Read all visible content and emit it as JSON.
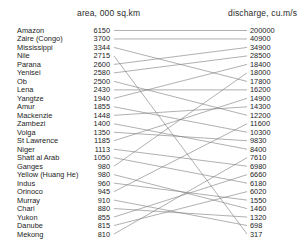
{
  "chart_data": {
    "type": "line",
    "subtype": "slopegraph",
    "title": "",
    "xlabel": "",
    "ylabel": "",
    "grid": false,
    "legend": null,
    "axes": [
      {
        "id": "area",
        "label": "area, 000 sq.km",
        "position": "left",
        "order": "descending"
      },
      {
        "id": "discharge",
        "label": "discharge, cu.m/s",
        "position": "right",
        "order": "descending"
      }
    ],
    "categories": [
      "Amazon",
      "Zaire (Congo)",
      "Mississippi",
      "Nile",
      "Parana",
      "Yenisei",
      "Ob",
      "Lena",
      "Yangtze",
      "Amur",
      "Mackenzie",
      "Zambezi",
      "Volga",
      "St Lawrence",
      "Niger",
      "Shatt al Arab",
      "Ganges",
      "Yellow (Huang He)",
      "Indus",
      "Orinoco",
      "Murray",
      "Chari",
      "Yukon",
      "Danube",
      "Mekong"
    ],
    "series": [
      {
        "name": "area, 000 sq.km",
        "values": [
          6150,
          3700,
          3344,
          2715,
          2600,
          2580,
          2500,
          2430,
          1940,
          1855,
          1448,
          1400,
          1350,
          1185,
          1113,
          1050,
          980,
          980,
          960,
          945,
          910,
          880,
          855,
          815,
          810
        ]
      },
      {
        "name": "discharge, cu.m/s",
        "values": [
          200000,
          40900,
          34900,
          28500,
          18400,
          18000,
          17800,
          16200,
          14900,
          14300,
          12200,
          11600,
          10300,
          9830,
          8400,
          7610,
          6980,
          6660,
          6180,
          6020,
          1550,
          1460,
          1320,
          698,
          317
        ]
      }
    ],
    "rows": [
      {
        "river": "Amazon",
        "area": "6150",
        "area_rank": 1,
        "discharge": "200000",
        "discharge_rank": 1
      },
      {
        "river": "Zaire (Congo)",
        "area": "3700",
        "area_rank": 2,
        "discharge": "40900",
        "discharge_rank": 2
      },
      {
        "river": "Mississippi",
        "area": "3344",
        "area_rank": 3,
        "discharge": "34900",
        "discharge_rank": 3
      },
      {
        "river": "Nile",
        "area": "2715",
        "area_rank": 4,
        "discharge": "28500",
        "discharge_rank": 4
      },
      {
        "river": "Parana",
        "area": "2600",
        "area_rank": 5,
        "discharge": "18400",
        "discharge_rank": 5
      },
      {
        "river": "Yenisei",
        "area": "2580",
        "area_rank": 6,
        "discharge": "18000",
        "discharge_rank": 6
      },
      {
        "river": "Ob",
        "area": "2500",
        "area_rank": 7,
        "discharge": "17800",
        "discharge_rank": 7
      },
      {
        "river": "Lena",
        "area": "2430",
        "area_rank": 8,
        "discharge": "16200",
        "discharge_rank": 8
      },
      {
        "river": "Yangtze",
        "area": "1940",
        "area_rank": 9,
        "discharge": "14900",
        "discharge_rank": 9
      },
      {
        "river": "Amur",
        "area": "1855",
        "area_rank": 10,
        "discharge": "14300",
        "discharge_rank": 10
      },
      {
        "river": "Mackenzie",
        "area": "1448",
        "area_rank": 11,
        "discharge": "12200",
        "discharge_rank": 11
      },
      {
        "river": "Zambezi",
        "area": "1400",
        "area_rank": 12,
        "discharge": "11600",
        "discharge_rank": 12
      },
      {
        "river": "Volga",
        "area": "1350",
        "area_rank": 13,
        "discharge": "10300",
        "discharge_rank": 13
      },
      {
        "river": "St Lawrence",
        "area": "1185",
        "area_rank": 14,
        "discharge": "9830",
        "discharge_rank": 14
      },
      {
        "river": "Niger",
        "area": "1113",
        "area_rank": 15,
        "discharge": "8400",
        "discharge_rank": 15
      },
      {
        "river": "Shatt al Arab",
        "area": "1050",
        "area_rank": 16,
        "discharge": "7610",
        "discharge_rank": 16
      },
      {
        "river": "Ganges",
        "area": "980",
        "area_rank": 17,
        "discharge": "6980",
        "discharge_rank": 17
      },
      {
        "river": "Yellow (Huang He)",
        "area": "980",
        "area_rank": 18,
        "discharge": "6660",
        "discharge_rank": 18
      },
      {
        "river": "Indus",
        "area": "960",
        "area_rank": 19,
        "discharge": "6180",
        "discharge_rank": 19
      },
      {
        "river": "Orinoco",
        "area": "945",
        "area_rank": 20,
        "discharge": "6020",
        "discharge_rank": 20
      },
      {
        "river": "Murray",
        "area": "910",
        "area_rank": 21,
        "discharge": "1550",
        "discharge_rank": 21
      },
      {
        "river": "Chari",
        "area": "880",
        "area_rank": 22,
        "discharge": "1460",
        "discharge_rank": 22
      },
      {
        "river": "Yukon",
        "area": "855",
        "area_rank": 23,
        "discharge": "1320",
        "discharge_rank": 23
      },
      {
        "river": "Danube",
        "area": "815",
        "area_rank": 24,
        "discharge": "698",
        "discharge_rank": 24
      },
      {
        "river": "Mekong",
        "area": "810",
        "area_rank": 25,
        "discharge": "317",
        "discharge_rank": 25
      }
    ],
    "links": [
      {
        "river": "Amazon",
        "from_rank": 1,
        "to_rank": 1
      },
      {
        "river": "Zaire (Congo)",
        "from_rank": 2,
        "to_rank": 2
      },
      {
        "river": "Mississippi",
        "from_rank": 3,
        "to_rank": 7
      },
      {
        "river": "Nile",
        "from_rank": 4,
        "to_rank": 25
      },
      {
        "river": "Parana",
        "from_rank": 5,
        "to_rank": 3
      },
      {
        "river": "Yenisei",
        "from_rank": 6,
        "to_rank": 4
      },
      {
        "river": "Ob",
        "from_rank": 7,
        "to_rank": 11
      },
      {
        "river": "Lena",
        "from_rank": 8,
        "to_rank": 8
      },
      {
        "river": "Yangtze",
        "from_rank": 9,
        "to_rank": 5
      },
      {
        "river": "Amur",
        "from_rank": 10,
        "to_rank": 13
      },
      {
        "river": "Mackenzie",
        "from_rank": 11,
        "to_rank": 10
      },
      {
        "river": "Zambezi",
        "from_rank": 12,
        "to_rank": 15
      },
      {
        "river": "Volga",
        "from_rank": 13,
        "to_rank": 14
      },
      {
        "river": "St Lawrence",
        "from_rank": 14,
        "to_rank": 9
      },
      {
        "river": "Niger",
        "from_rank": 15,
        "to_rank": 17
      },
      {
        "river": "Shatt al Arab",
        "from_rank": 16,
        "to_rank": 19
      },
      {
        "river": "Ganges",
        "from_rank": 17,
        "to_rank": 6
      },
      {
        "river": "Yellow (Huang He)",
        "from_rank": 18,
        "to_rank": 22
      },
      {
        "river": "Indus",
        "from_rank": 19,
        "to_rank": 21
      },
      {
        "river": "Orinoco",
        "from_rank": 20,
        "to_rank": 12
      },
      {
        "river": "Murray",
        "from_rank": 21,
        "to_rank": 24
      },
      {
        "river": "Chari",
        "from_rank": 22,
        "to_rank": 23
      },
      {
        "river": "Yukon",
        "from_rank": 23,
        "to_rank": 18
      },
      {
        "river": "Danube",
        "from_rank": 24,
        "to_rank": 20
      },
      {
        "river": "Mekong",
        "from_rank": 25,
        "to_rank": 16
      }
    ],
    "style": {
      "line_color": "#7a7a7a",
      "text_color": "#232323",
      "background": "#ffffff"
    }
  }
}
